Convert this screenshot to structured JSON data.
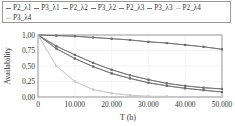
{
  "legend": {
    "items": [
      {
        "label": "P2_λ1",
        "color": "#6e6e6e"
      },
      {
        "label": "P3_λ1",
        "color": "#6e6e6e"
      },
      {
        "label": "P2_λ2",
        "color": "#6e6e6e"
      },
      {
        "label": "P3_λ2",
        "color": "#6e6e6e"
      },
      {
        "label": "P2_λ3",
        "color": "#6e6e6e"
      },
      {
        "label": "P3_λ3",
        "color": "#6e6e6e"
      },
      {
        "label": "P2_λ4",
        "color": "#c8c8c8"
      },
      {
        "label": "P3_λ4",
        "color": "#c8c8c8"
      }
    ]
  },
  "axes": {
    "xlabel": "T (h)",
    "ylabel": "Availability",
    "xticks": [
      "0",
      "10.000",
      "20.000",
      "30.000",
      "40.000",
      "50.000"
    ],
    "yticks": [
      "1,00",
      "0,75",
      "0,50",
      "0,25",
      "0,00"
    ]
  },
  "chart_data": {
    "type": "line",
    "title": "",
    "xlabel": "T (h)",
    "ylabel": "Availability",
    "xlim": [
      0,
      50000
    ],
    "ylim": [
      0,
      1
    ],
    "grid": true,
    "legend_position": "top",
    "x": [
      0,
      5000,
      10000,
      15000,
      20000,
      25000,
      30000,
      35000,
      40000,
      45000,
      50000
    ],
    "series": [
      {
        "name": "P2_λ1",
        "values": [
          1.0,
          0.99,
          0.98,
          0.96,
          0.94,
          0.92,
          0.89,
          0.87,
          0.84,
          0.81,
          0.77
        ]
      },
      {
        "name": "P3_λ1",
        "values": [
          1.0,
          0.99,
          0.98,
          0.96,
          0.94,
          0.92,
          0.89,
          0.87,
          0.84,
          0.81,
          0.77
        ]
      },
      {
        "name": "P2_λ2",
        "values": [
          1.0,
          0.82,
          0.68,
          0.55,
          0.44,
          0.35,
          0.28,
          0.22,
          0.18,
          0.15,
          0.13
        ]
      },
      {
        "name": "P3_λ2",
        "values": [
          1.0,
          0.82,
          0.68,
          0.55,
          0.44,
          0.35,
          0.28,
          0.22,
          0.18,
          0.15,
          0.13
        ]
      },
      {
        "name": "P2_λ3",
        "values": [
          1.0,
          0.78,
          0.62,
          0.49,
          0.38,
          0.3,
          0.23,
          0.18,
          0.14,
          0.11,
          0.08
        ]
      },
      {
        "name": "P3_λ3",
        "values": [
          1.0,
          0.78,
          0.62,
          0.49,
          0.38,
          0.3,
          0.23,
          0.18,
          0.14,
          0.11,
          0.08
        ]
      },
      {
        "name": "P2_λ4",
        "values": [
          1.0,
          0.5,
          0.25,
          0.12,
          0.06,
          0.03,
          0.01,
          0.01,
          0.0,
          0.0,
          0.0
        ]
      },
      {
        "name": "P3_λ4",
        "values": [
          1.0,
          0.5,
          0.25,
          0.12,
          0.06,
          0.03,
          0.01,
          0.01,
          0.0,
          0.0,
          0.0
        ]
      }
    ]
  }
}
